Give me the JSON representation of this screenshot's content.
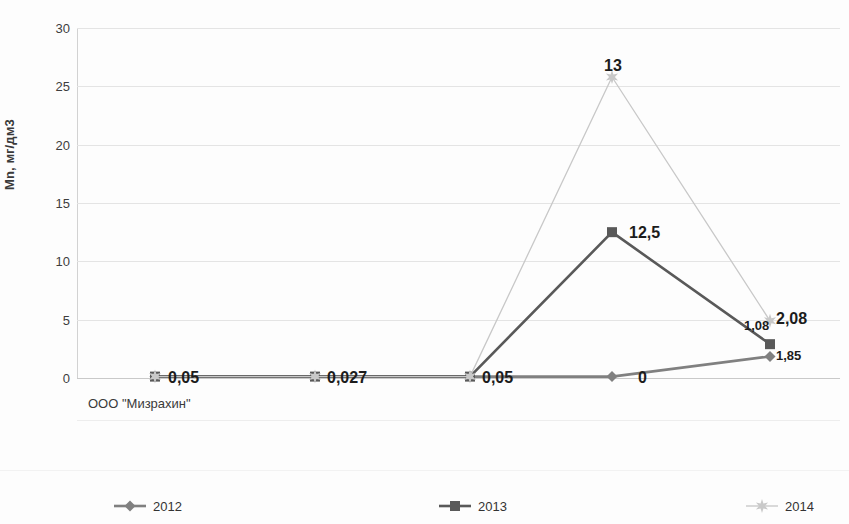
{
  "chart_data": {
    "type": "line",
    "title": "",
    "xlabel": "",
    "ylabel": "Mn, мг/дм3",
    "categories": [
      "ООО \"Мизрахин\"",
      "",
      "",
      "",
      ""
    ],
    "category_label": "ООО \"Мизрахин\"",
    "ylim": [
      0,
      30
    ],
    "yticks": [
      0,
      5,
      10,
      15,
      20,
      25,
      30
    ],
    "ytick_labels": [
      "0",
      "5",
      "10",
      "15",
      "20",
      "25",
      "30"
    ],
    "grid": true,
    "legend_position": "bottom",
    "series": [
      {
        "name": "2012",
        "marker": "diamond",
        "color": "#808080",
        "values": [
          0.05,
          0.027,
          0.05,
          0,
          1.85
        ],
        "plotted": [
          0.12,
          0.12,
          0.12,
          0.12,
          1.85
        ],
        "labels": [
          "",
          "",
          "",
          "0",
          "1,85"
        ]
      },
      {
        "name": "2013",
        "marker": "square",
        "color": "#595959",
        "values": [
          0.05,
          0.027,
          0.05,
          12.5,
          2.08
        ],
        "plotted": [
          0.12,
          0.12,
          0.12,
          12.5,
          2.9
        ],
        "labels": [
          "",
          "",
          "",
          "12,5",
          "2,08"
        ]
      },
      {
        "name": "2014",
        "marker": "star",
        "color": "#c8c8c8",
        "values": [
          0.05,
          0.027,
          0.05,
          13,
          1.08
        ],
        "plotted": [
          0.12,
          0.12,
          0.12,
          25.8,
          4.9
        ],
        "labels": [
          "0,05",
          "0,027",
          "0,05",
          "13",
          "1,08"
        ]
      }
    ],
    "point_labels": [
      {
        "text": "0,05",
        "x": 168,
        "y": 369,
        "size": "big"
      },
      {
        "text": "0,027",
        "x": 327,
        "y": 369,
        "size": "big"
      },
      {
        "text": "0,05",
        "x": 482,
        "y": 369,
        "size": "big"
      },
      {
        "text": "0",
        "x": 638,
        "y": 369,
        "size": "big"
      },
      {
        "text": "13",
        "x": 604,
        "y": 57,
        "size": "big"
      },
      {
        "text": "12,5",
        "x": 629,
        "y": 224,
        "size": "big"
      },
      {
        "text": "1,08",
        "x": 744,
        "y": 318,
        "size": "sm"
      },
      {
        "text": "2,08",
        "x": 776,
        "y": 310,
        "size": "big"
      },
      {
        "text": "1,85",
        "x": 776,
        "y": 348,
        "size": "sm"
      }
    ],
    "legend_entries": [
      {
        "label": "2012",
        "marker": "diamond",
        "color": "#808080",
        "x": 113
      },
      {
        "label": "2013",
        "marker": "square",
        "color": "#595959",
        "x": 438
      },
      {
        "label": "2014",
        "marker": "star",
        "color": "#c9c9c9",
        "x": 745
      }
    ]
  }
}
